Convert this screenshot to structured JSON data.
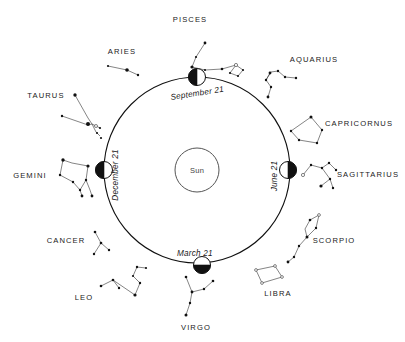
{
  "figure": {
    "center_body": "Sun",
    "line_color": "#111111",
    "text_color": "#1a1a1a"
  },
  "sun": {
    "label": "Sun"
  },
  "orbit": {
    "center_x": 197,
    "center_y": 170,
    "radius": 93
  },
  "season_positions": [
    {
      "label": "September 21",
      "angle_deg": 270,
      "rotation": -9,
      "x": 171,
      "y": 100,
      "marker_x": 197,
      "marker_y": 77,
      "dark_half": "left"
    },
    {
      "label": "December 21",
      "angle_deg": 180,
      "rotation": -90,
      "x": 118,
      "y": 175,
      "marker_x": 104,
      "marker_y": 170,
      "dark_half": "left"
    },
    {
      "label": "March 21",
      "angle_deg": 90,
      "rotation": 0,
      "x": 177,
      "y": 256,
      "marker_x": 202,
      "marker_y": 265,
      "dark_half": "bottom"
    },
    {
      "label": "June 21",
      "angle_deg": 0,
      "rotation": -90,
      "x": 277,
      "y": 176,
      "marker_x": 288,
      "marker_y": 170,
      "dark_half": "right"
    }
  ],
  "zodiac": [
    {
      "name": "PISCES",
      "label_x": 190,
      "label_y": 22,
      "anchor": "middle"
    },
    {
      "name": "ARIES",
      "label_x": 122,
      "label_y": 54,
      "anchor": "middle"
    },
    {
      "name": "TAURUS",
      "label_x": 46,
      "label_y": 98,
      "anchor": "middle"
    },
    {
      "name": "GEMINI",
      "label_x": 30,
      "label_y": 178,
      "anchor": "middle"
    },
    {
      "name": "CANCER",
      "label_x": 66,
      "label_y": 243,
      "anchor": "middle"
    },
    {
      "name": "LEO",
      "label_x": 84,
      "label_y": 300,
      "anchor": "middle"
    },
    {
      "name": "VIRGO",
      "label_x": 196,
      "label_y": 330,
      "anchor": "middle"
    },
    {
      "name": "LIBRA",
      "label_x": 278,
      "label_y": 296,
      "anchor": "middle"
    },
    {
      "name": "SCORPIO",
      "label_x": 334,
      "label_y": 243,
      "anchor": "middle"
    },
    {
      "name": "SAGITTARIUS",
      "label_x": 368,
      "label_y": 177,
      "anchor": "middle"
    },
    {
      "name": "CAPRICORNUS",
      "label_x": 359,
      "label_y": 126,
      "anchor": "middle"
    },
    {
      "name": "AQUARIUS",
      "label_x": 314,
      "label_y": 62,
      "anchor": "middle"
    }
  ]
}
